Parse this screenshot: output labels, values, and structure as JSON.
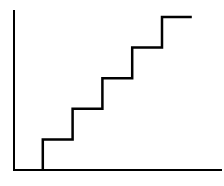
{
  "chart_data": {
    "type": "line",
    "subtype": "step",
    "title": "",
    "xlabel": "",
    "ylabel": "",
    "x_ticks": [],
    "y_ticks": [],
    "grid": false,
    "legend": null,
    "series": [
      {
        "name": "step",
        "color": "#000000",
        "points": [
          {
            "x": 1,
            "y": 0
          },
          {
            "x": 1,
            "y": 1
          },
          {
            "x": 2,
            "y": 1
          },
          {
            "x": 2,
            "y": 2
          },
          {
            "x": 3,
            "y": 2
          },
          {
            "x": 3,
            "y": 3
          },
          {
            "x": 4,
            "y": 3
          },
          {
            "x": 4,
            "y": 4
          },
          {
            "x": 5,
            "y": 4
          },
          {
            "x": 5,
            "y": 5
          },
          {
            "x": 6,
            "y": 5
          }
        ]
      }
    ],
    "xlim": [
      0,
      7
    ],
    "ylim": [
      0,
      5.5
    ]
  },
  "style": {
    "axis_color": "#000000",
    "line_color": "#000000",
    "background": "#ffffff"
  }
}
